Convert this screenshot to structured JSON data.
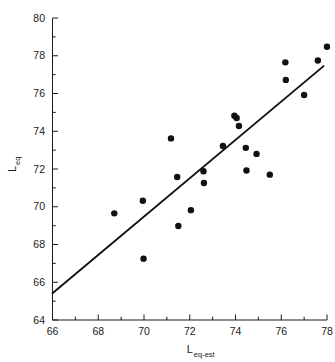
{
  "chart_data": {
    "type": "scatter",
    "title": "",
    "subtitle": "",
    "xlabel": "L",
    "xlabel_sub": "eq-est",
    "ylabel": "L",
    "ylabel_sub": "eq",
    "xlim": [
      66,
      78
    ],
    "ylim": [
      64,
      80
    ],
    "xticks": [
      66,
      68,
      70,
      72,
      74,
      76,
      78
    ],
    "yticks": [
      64,
      66,
      68,
      70,
      72,
      74,
      76,
      78,
      80
    ],
    "xtick_labels": [
      "66",
      "68",
      "70",
      "72",
      "74",
      "76",
      "78"
    ],
    "ytick_labels": [
      "64",
      "66",
      "68",
      "70",
      "72",
      "74",
      "76",
      "78",
      "80"
    ],
    "xminor_step": 1,
    "yminor_step": 1,
    "grid": false,
    "legend": null,
    "legend_position": "none",
    "marker": "filled-circle",
    "marker_color": "#111111",
    "marker_size_px": 4.4,
    "points": [
      {
        "x": 68.7,
        "y": 69.65
      },
      {
        "x": 69.95,
        "y": 70.32
      },
      {
        "x": 69.98,
        "y": 67.25
      },
      {
        "x": 71.18,
        "y": 73.62
      },
      {
        "x": 71.45,
        "y": 71.58
      },
      {
        "x": 71.5,
        "y": 68.98
      },
      {
        "x": 72.05,
        "y": 69.82
      },
      {
        "x": 72.6,
        "y": 71.88
      },
      {
        "x": 72.62,
        "y": 71.26
      },
      {
        "x": 73.45,
        "y": 73.22
      },
      {
        "x": 73.95,
        "y": 74.82
      },
      {
        "x": 74.05,
        "y": 74.7
      },
      {
        "x": 74.15,
        "y": 74.28
      },
      {
        "x": 74.45,
        "y": 73.12
      },
      {
        "x": 74.48,
        "y": 71.92
      },
      {
        "x": 74.92,
        "y": 72.8
      },
      {
        "x": 75.5,
        "y": 71.7
      },
      {
        "x": 76.18,
        "y": 77.65
      },
      {
        "x": 76.2,
        "y": 76.72
      },
      {
        "x": 77.0,
        "y": 75.92
      },
      {
        "x": 77.6,
        "y": 77.75
      },
      {
        "x": 78.0,
        "y": 78.48
      }
    ],
    "fit_line": {
      "type": "linear-regression",
      "x_start": 66.0,
      "y_start": 65.42,
      "x_end": 77.85,
      "y_end": 77.45,
      "color": "#111111"
    }
  }
}
